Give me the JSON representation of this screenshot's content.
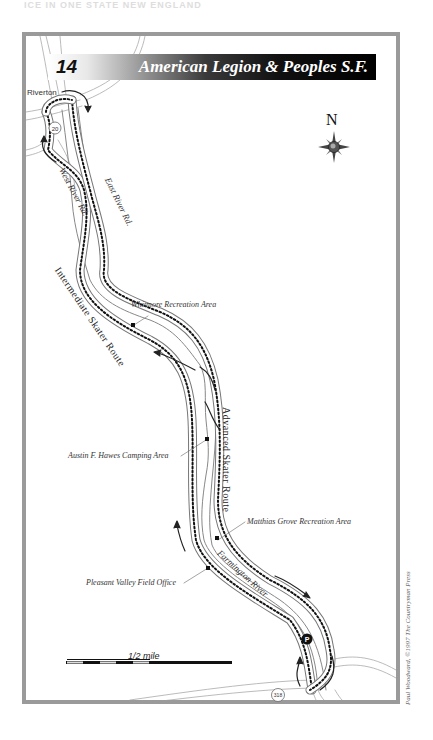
{
  "page_header": "ICE IN ONE STATE NEW ENGLAND",
  "banner": {
    "number": "14",
    "title": "American Legion & Peoples S.F."
  },
  "compass": {
    "label": "N",
    "icon": "compass-rose-icon"
  },
  "towns": [
    {
      "name": "Riverton"
    }
  ],
  "roads": [
    {
      "name": "West River Rd."
    },
    {
      "name": "East River Rd."
    },
    {
      "name": "20",
      "type": "route-shield"
    },
    {
      "name": "318",
      "type": "route-shield"
    }
  ],
  "routes": [
    {
      "name": "Intermediate Skater Route"
    },
    {
      "name": "Advanced Skater Route"
    }
  ],
  "water": [
    {
      "name": "Farmington River"
    }
  ],
  "points_of_interest": [
    {
      "name": "Whitmore Recreation Area"
    },
    {
      "name": "Austin F. Hawes Camping Area"
    },
    {
      "name": "Matthias Grove Recreation Area"
    },
    {
      "name": "Pleasant Valley Field Office"
    },
    {
      "name": "P",
      "type": "parking-icon"
    }
  ],
  "scale": {
    "label": "1/2 mile"
  },
  "credit": "Paul Woodward, ©1997 The Countryman Press",
  "colors": {
    "frame": "#9a9a9a",
    "banner_dark": "#000000",
    "route_dots": "#111111",
    "road_line": "#888888"
  }
}
